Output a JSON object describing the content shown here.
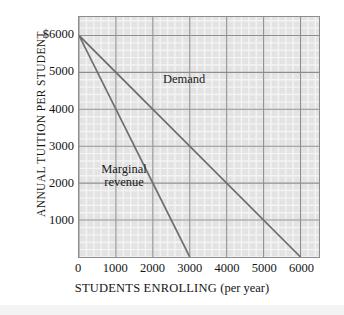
{
  "chart_data": {
    "type": "line",
    "title": "",
    "xlabel": "STUDENTS ENROLLING (per year)",
    "ylabel": "ANNUAL TUITION PER STUDENT",
    "xlim": [
      0,
      6500
    ],
    "ylim": [
      0,
      6500
    ],
    "xticks": [
      0,
      1000,
      2000,
      3000,
      4000,
      5000,
      6000
    ],
    "xtick_labels": [
      "0",
      "1000",
      "2000",
      "3000",
      "4000",
      "5000",
      "6000"
    ],
    "yticks": [
      1000,
      2000,
      3000,
      4000,
      5000,
      6000
    ],
    "ytick_labels": [
      "1000",
      "2000",
      "3000",
      "4000",
      "5000",
      "$6000"
    ],
    "grid": true,
    "minor_grid": true,
    "minor_subdivisions": 5,
    "legend": "none",
    "series": [
      {
        "name": "Demand",
        "label": "Demand",
        "points": [
          [
            0,
            6000
          ],
          [
            6000,
            0
          ]
        ],
        "color": "#6e6e6e"
      },
      {
        "name": "Marginal revenue",
        "label_line1": "Marginal",
        "label_line2": "revenue",
        "points": [
          [
            0,
            6000
          ],
          [
            3000,
            0
          ]
        ],
        "color": "#6e6e6e"
      }
    ],
    "colors": {
      "plot_background": "#e3e3e3",
      "major_gridline": "#8d8d8d",
      "minor_gridline": "#f4f4f4",
      "line": "#6e6e6e",
      "text": "#141414",
      "page_background": "#ffffff"
    }
  },
  "axes": {
    "y_title": "ANNUAL TUITION PER STUDENT",
    "x_title_main": "STUDENTS ENROLLING",
    "x_title_sub": "(per year)"
  }
}
